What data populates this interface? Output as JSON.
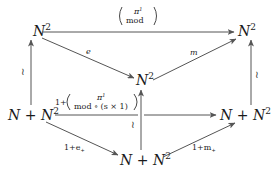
{
  "diagram": {
    "nodes": {
      "top_left": {
        "base": "N",
        "sup": "2"
      },
      "top_right": {
        "base": "N",
        "sup": "2"
      },
      "center": {
        "base": "N",
        "sup": "2"
      },
      "mid_left": {
        "text": "N + N",
        "sup": "2"
      },
      "mid_right": {
        "text": "N + N",
        "sup": "2"
      },
      "bottom": {
        "text": "N + N",
        "sup": "2"
      }
    },
    "edges": {
      "top": {
        "label_top": "π",
        "label_top_sup": "1",
        "label_bottom": "mod"
      },
      "diag_e": {
        "label": "e"
      },
      "diag_m": {
        "label": "m"
      },
      "left_vertical": {
        "label": "≀"
      },
      "right_vertical": {
        "label": "≀"
      },
      "center_vertical": {
        "label": "≀"
      },
      "middle": {
        "prefix": "1+",
        "label_top": "π",
        "label_top_sup": "1",
        "label_bottom": "mod ∘ (s × 1)"
      },
      "diag_e_plus": {
        "label": "1+e",
        "sub": "+"
      },
      "diag_m_plus": {
        "label": "1+m",
        "sub": "+"
      }
    },
    "colors": {
      "ink": "#1a1a1a",
      "arrow": "#555555",
      "background": "#ffffff"
    }
  }
}
